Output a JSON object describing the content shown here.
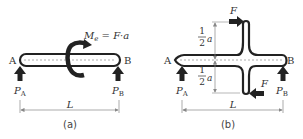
{
  "figure_a": {
    "caption": "(a)",
    "left_end": "A",
    "right_end": "B",
    "moment_label": "M",
    "moment_sub": "e",
    "moment_expr": " = F·a",
    "reaction_left": "P",
    "reaction_left_sub": "A",
    "reaction_right": "P",
    "reaction_right_sub": "B",
    "span_label": "L"
  },
  "figure_b": {
    "caption": "(b)",
    "left_end": "A",
    "right_end": "B",
    "force_top": "F",
    "force_bottom": "F",
    "half_upper_num": "1",
    "half_upper_den": "2",
    "half_upper_var": "a",
    "half_lower_num": "1",
    "half_lower_den": "2",
    "half_lower_var": "a",
    "reaction_left": "P",
    "reaction_left_sub": "A",
    "reaction_right": "P",
    "reaction_right_sub": "B",
    "span_label": "L"
  },
  "colors": {
    "stroke": "#222222",
    "dashed": "#999999",
    "dimension": "#888888"
  }
}
